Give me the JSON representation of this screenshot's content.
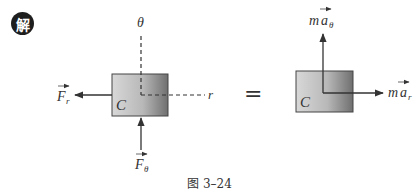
{
  "badge": {
    "label": "解"
  },
  "left_diagram": {
    "body_label": "C",
    "axis_theta_label": "θ",
    "axis_r_label": "r",
    "force_r": {
      "symbol": "F",
      "subscript": "r"
    },
    "force_theta": {
      "symbol": "F",
      "subscript": "θ"
    }
  },
  "equals": "=",
  "right_diagram": {
    "body_label": "C",
    "inertia_theta": {
      "mass": "m",
      "symbol": "a",
      "subscript": "θ"
    },
    "inertia_r": {
      "mass": "m",
      "symbol": "a",
      "subscript": "r"
    }
  },
  "caption": "图 3–24",
  "colors": {
    "box_dark": "#7a7a7a",
    "box_light": "#d4d4d4",
    "line": "#333333"
  }
}
